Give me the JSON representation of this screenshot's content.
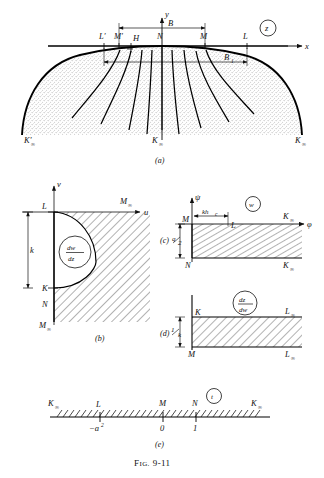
{
  "figure": {
    "caption_prefix": "F",
    "caption_small": "IG.",
    "caption_number": "9-11"
  },
  "panel_a": {
    "id": "(a)",
    "plane_badge": "z",
    "axis_y": "y",
    "axis_x": "x",
    "dimension_B": "B",
    "dimension_B1": "B",
    "dimension_B1_sub": "1",
    "points": {
      "L_prime": "L′",
      "M_prime": "M′",
      "H": "H",
      "N": "N",
      "M": "M",
      "L": "L"
    },
    "corner_left": "K′",
    "corner_left_sub": "∞",
    "corner_center": "K",
    "corner_center_sub": "∞",
    "corner_right": "K",
    "corner_right_sub": "∞"
  },
  "panel_b": {
    "id": "(b)",
    "axis_v": "v",
    "axis_u": "u",
    "badge_num": "dw",
    "badge_den": "dz",
    "dimension_k": "k",
    "points": {
      "L": "L",
      "M_inf": "M",
      "M_inf_sub": "∞",
      "K": "K",
      "N": "N",
      "M_inf_bottom": "M",
      "M_inf_bottom_sub": "∞"
    }
  },
  "panel_c": {
    "id": "(c)",
    "plane_badge": "w",
    "axis_psi": "ψ",
    "axis_phi": "φ",
    "dimension_khc": "kh",
    "dimension_khc_sub": "c",
    "dimension_q_num": "q",
    "dimension_q_den": "2",
    "points": {
      "M_top": "M",
      "L": "L",
      "K_inf_top": "K",
      "K_inf_top_sub": "∞",
      "N": "N",
      "K_inf_bottom": "K",
      "K_inf_bottom_sub": "∞"
    }
  },
  "panel_d": {
    "id": "(d)",
    "badge_num": "dz",
    "badge_den": "dw",
    "dimension_num": "1",
    "dimension_den": "k",
    "points": {
      "K": "K",
      "L_inf_top": "L",
      "L_inf_top_sub": "∞",
      "M": "M",
      "L_inf_bottom": "L",
      "L_inf_bottom_sub": "∞"
    }
  },
  "panel_e": {
    "id": "(e)",
    "plane_badge": "t",
    "points": {
      "K_inf_left": "K",
      "K_inf_left_sub": "∞",
      "L": "L",
      "M": "M",
      "N": "N",
      "K_inf_right": "K",
      "K_inf_right_sub": "∞"
    },
    "ticks": {
      "minus_a2": "−a",
      "minus_a2_sup": "2",
      "zero": "0",
      "one": "1"
    }
  }
}
